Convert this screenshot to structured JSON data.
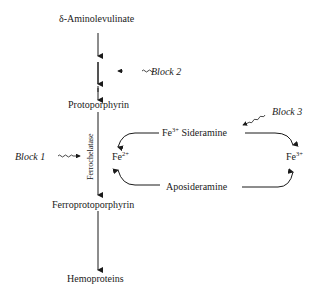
{
  "nodes": {
    "aminolevulinate": "δ-Aminolevulinate",
    "protoporphyrin": "Protoporphyrin",
    "ferroprotoporphyrin": "Ferroprotoporphyrin",
    "hemoproteins": "Hemoproteins",
    "fe3_sideramine_prefix": "Fe",
    "fe3_sideramine_sup": "3+",
    "sideramine": "Sideramine",
    "aposideramine": "Aposideramine",
    "fe2_base": "Fe",
    "fe2_sup": "2+",
    "fe3_base": "Fe",
    "fe3_sup": "3+"
  },
  "enzyme": "Ferrochelatase",
  "blocks": {
    "block1": "Block 1",
    "block2": "Block 2",
    "block3": "Block 3"
  }
}
